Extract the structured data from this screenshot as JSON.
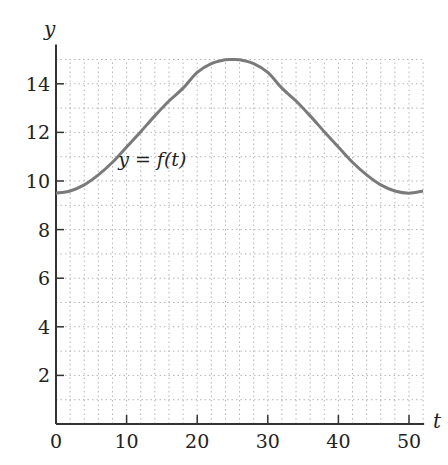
{
  "chart_data": {
    "type": "line",
    "title": "",
    "xlabel": "t",
    "ylabel": "y",
    "xlim": [
      0,
      52
    ],
    "ylim": [
      0,
      15
    ],
    "xticks": [
      0,
      10,
      20,
      30,
      40,
      50
    ],
    "xtick_labels": [
      "0",
      "10",
      "20",
      "30",
      "40",
      "50"
    ],
    "yticks": [
      2,
      4,
      6,
      8,
      10,
      12,
      14
    ],
    "ytick_labels": [
      "2",
      "4",
      "6",
      "8",
      "10",
      "12",
      "14"
    ],
    "grid": {
      "on": true,
      "style": "dotted",
      "x_step": 2,
      "y_step": 1
    },
    "legend": null,
    "annotations": [
      {
        "text": "y = f(t)",
        "t": 8.8,
        "y": 10.6
      }
    ],
    "series": [
      {
        "name": "y = f(t)",
        "x": [
          0,
          2,
          4,
          6,
          8,
          10,
          12,
          14,
          16,
          18,
          20,
          22,
          24,
          25,
          26,
          28,
          30,
          32,
          34,
          36,
          38,
          40,
          42,
          44,
          46,
          48,
          50,
          52
        ],
        "values": [
          9.5,
          9.59,
          9.84,
          10.25,
          10.77,
          11.4,
          12.03,
          12.68,
          13.29,
          13.82,
          14.47,
          14.83,
          14.99,
          15.0,
          14.99,
          14.83,
          14.47,
          13.82,
          13.29,
          12.68,
          12.03,
          11.4,
          10.77,
          10.25,
          9.84,
          9.59,
          9.5,
          9.59
        ]
      }
    ]
  }
}
